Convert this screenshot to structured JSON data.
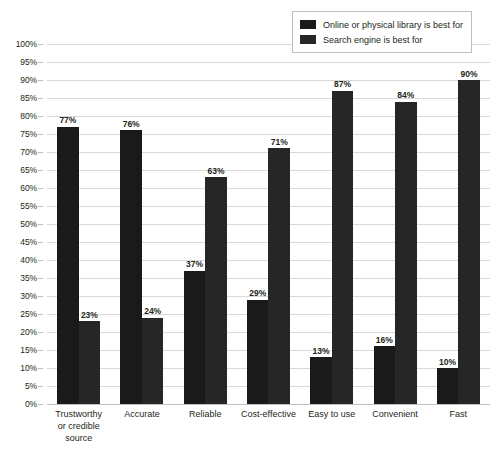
{
  "chart_data": {
    "type": "bar",
    "title": "",
    "xlabel": "",
    "ylabel": "",
    "ylim": [
      0,
      100
    ],
    "grid": true,
    "legend_position": "top-right",
    "categories": [
      "Trustworthy or credible source",
      "Accurate",
      "Reliable",
      "Cost-effective",
      "Easy to use",
      "Convenient",
      "Fast"
    ],
    "category_lines": [
      [
        "Trustworthy",
        "or credible",
        "source"
      ],
      [
        "Accurate"
      ],
      [
        "Reliable"
      ],
      [
        "Cost-effective"
      ],
      [
        "Easy to use"
      ],
      [
        "Convenient"
      ],
      [
        "Fast"
      ]
    ],
    "series": [
      {
        "name": "Online or physical library is best for",
        "color": "#1a1a1a",
        "values": [
          77,
          76,
          37,
          29,
          13,
          16,
          10
        ],
        "labels": [
          "77%",
          "76%",
          "37%",
          "29%",
          "13%",
          "16%",
          "10%"
        ]
      },
      {
        "name": "Search engine is best for",
        "color": "#262626",
        "values": [
          23,
          24,
          63,
          71,
          87,
          84,
          90
        ],
        "labels": [
          "23%",
          "24%",
          "63%",
          "71%",
          "87%",
          "84%",
          "90%"
        ]
      }
    ],
    "y_ticks": [
      "0%",
      "5%",
      "10%",
      "15%",
      "20%",
      "25%",
      "30%",
      "35%",
      "40%",
      "45%",
      "50%",
      "55%",
      "60%",
      "65%",
      "70%",
      "75%",
      "80%",
      "85%",
      "90%",
      "95%",
      "100%"
    ],
    "y_tick_values": [
      0,
      5,
      10,
      15,
      20,
      25,
      30,
      35,
      40,
      45,
      50,
      55,
      60,
      65,
      70,
      75,
      80,
      85,
      90,
      95,
      100
    ]
  },
  "legend": {
    "items": [
      {
        "label": "Online or physical library is best for"
      },
      {
        "label": "Search engine is best for"
      }
    ]
  }
}
